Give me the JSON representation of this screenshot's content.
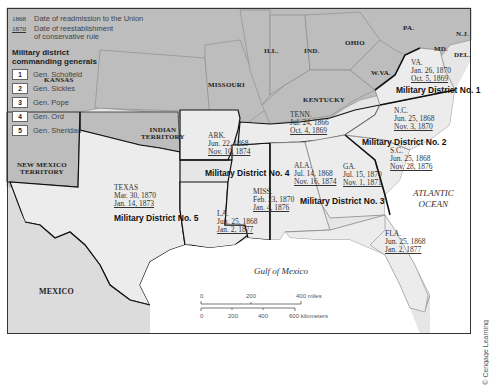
{
  "legend": {
    "readmission_year": "1868",
    "readmission_label": "Date of readmission to the Union",
    "conservative_year": "1870",
    "conservative_label_line1": "Date of reestablishment",
    "conservative_label_line2": "of conservative rule",
    "generals_heading_line1": "Military district",
    "generals_heading_line2": "commanding generals",
    "generals": [
      {
        "number": "1",
        "name": "Gen. Schofield"
      },
      {
        "number": "2",
        "name": "Gen. Sickles"
      },
      {
        "number": "3",
        "name": "Gen. Pope"
      },
      {
        "number": "4",
        "name": "Gen. Ord"
      },
      {
        "number": "5",
        "name": "Gen. Sheridan"
      }
    ]
  },
  "other_regions": {
    "kansas": "KANSAS",
    "missouri": "MISSOURI",
    "illinois": "ILL.",
    "indiana": "IND.",
    "ohio": "OHIO",
    "pennsylvania": "PA.",
    "new_jersey": "N.J.",
    "maryland": "MD.",
    "delaware": "DEL.",
    "west_virginia": "W.VA.",
    "kentucky": "KENTUCKY",
    "indian_territory_line1": "INDIAN",
    "indian_territory_line2": "TERRITORY",
    "new_mexico_line1": "NEW MEXICO",
    "new_mexico_line2": "TERRITORY",
    "mexico": "MEXICO"
  },
  "confederate_states": [
    {
      "abbr": "VA.",
      "readmission": "Jan. 26, 1870",
      "conservative": "Oct. 5, 1869"
    },
    {
      "abbr": "N.C.",
      "readmission": "Jun. 25, 1868",
      "conservative": "Nov. 3, 1870"
    },
    {
      "abbr": "S.C.",
      "readmission": "Jun. 25, 1868",
      "conservative": "Nov. 28, 1876"
    },
    {
      "abbr": "GA.",
      "readmission": "Jul. 15, 1870",
      "conservative": "Nov. 1, 1871"
    },
    {
      "abbr": "FLA.",
      "readmission": "Jun. 25, 1868",
      "conservative": "Jan. 2, 1877"
    },
    {
      "abbr": "ALA.",
      "readmission": "Jul. 14, 1868",
      "conservative": "Nov. 16, 1874"
    },
    {
      "abbr": "MISS.",
      "readmission": "Feb. 23, 1870",
      "conservative": "Jan. 4, 1876"
    },
    {
      "abbr": "LA.",
      "readmission": "Jun. 25, 1868",
      "conservative": "Jan. 2, 1877"
    },
    {
      "abbr": "ARK.",
      "readmission": "Jun. 22, 1868",
      "conservative": "Nov. 10, 1874"
    },
    {
      "abbr": "TENN.",
      "readmission": "Jul. 24, 1866",
      "conservative": "Oct. 4, 1869"
    },
    {
      "abbr": "TEXAS",
      "readmission": "Mar. 30, 1870",
      "conservative": "Jan. 14, 1873"
    }
  ],
  "districts": {
    "d1": "Military District No. 1",
    "d2": "Military District No. 2",
    "d3": "Military District No. 3",
    "d4": "Military District No. 4",
    "d5": "Military District No. 5"
  },
  "water": {
    "atlantic_line1": "ATLANTIC",
    "atlantic_line2": "OCEAN",
    "gulf": "Gulf of Mexico"
  },
  "scale_bar": {
    "miles_ticks": [
      "0",
      "200",
      "400 miles"
    ],
    "km_ticks": [
      "0",
      "200",
      "400",
      "600 kilometers"
    ]
  },
  "credit": "© Cengage Learning",
  "colors": {
    "non_confederate_fill": "#bdbdbd",
    "confederate_fill": "#ececec",
    "water": "#ffffff",
    "district_border": "#111111",
    "state_border": "#8a8a8a"
  }
}
